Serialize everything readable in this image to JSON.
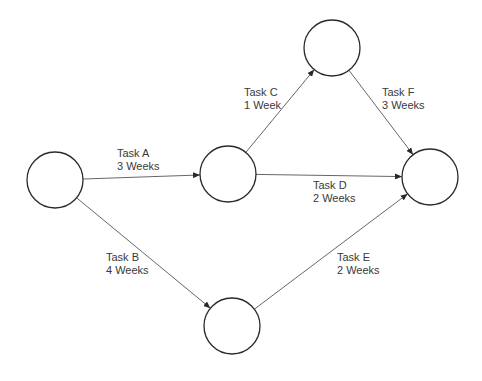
{
  "diagram": {
    "type": "network-diagram",
    "nodes": [
      {
        "id": "n1",
        "cx": 55,
        "cy": 180,
        "r": 28
      },
      {
        "id": "n2",
        "cx": 228,
        "cy": 174,
        "r": 28
      },
      {
        "id": "n3",
        "cx": 332,
        "cy": 48,
        "r": 28
      },
      {
        "id": "n4",
        "cx": 430,
        "cy": 177,
        "r": 28
      },
      {
        "id": "n5",
        "cx": 232,
        "cy": 326,
        "r": 28
      }
    ],
    "edges": [
      {
        "id": "task-a",
        "from": "n1",
        "to": "n2",
        "name": "Task A",
        "duration": "3 Weeks",
        "label_x": 117,
        "label_y": 157
      },
      {
        "id": "task-b",
        "from": "n1",
        "to": "n5",
        "name": "Task B",
        "duration": "4 Weeks",
        "label_x": 106,
        "label_y": 261
      },
      {
        "id": "task-c",
        "from": "n2",
        "to": "n3",
        "name": "Task C",
        "duration": "1 Week",
        "label_x": 244,
        "label_y": 96
      },
      {
        "id": "task-d",
        "from": "n2",
        "to": "n4",
        "name": "Task D",
        "duration": "2 Weeks",
        "label_x": 313,
        "label_y": 189
      },
      {
        "id": "task-e",
        "from": "n5",
        "to": "n4",
        "name": "Task E",
        "duration": "2 Weeks",
        "label_x": 337,
        "label_y": 261
      },
      {
        "id": "task-f",
        "from": "n3",
        "to": "n4",
        "name": "Task F",
        "duration": "3 Weeks",
        "label_x": 382,
        "label_y": 96
      }
    ]
  },
  "colors": {
    "node_stroke": "#2a2a2a",
    "edge_stroke": "#555555",
    "label_text": "#3a3a3a",
    "background": "#ffffff"
  }
}
